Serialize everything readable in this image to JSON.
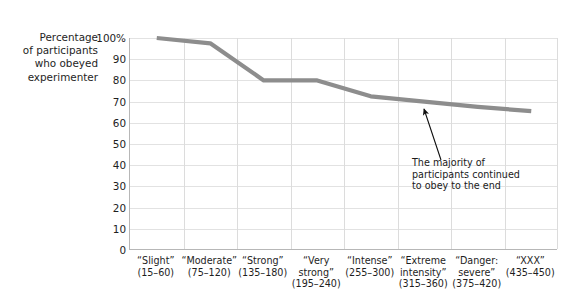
{
  "chart_data": {
    "type": "line",
    "title": "",
    "subtitle": "",
    "ylabel": "Percentage\nof participants\nwho obeyed\nexperimenter",
    "xlabel": "",
    "ylim": [
      0,
      100
    ],
    "ytick_values": [
      100,
      90,
      80,
      70,
      60,
      50,
      40,
      30,
      20,
      10,
      0
    ],
    "ytick_labels": [
      "100%",
      "90",
      "80",
      "70",
      "60",
      "50",
      "40",
      "30",
      "20",
      "10",
      "0"
    ],
    "grid": "both",
    "legend": "none",
    "line_color": "#8d8d8d",
    "categories": [
      "“Slight”\n(15–60)",
      "“Moderate”\n(75–120)",
      "“Strong”\n(135–180)",
      "“Very\nstrong”\n(195–240)",
      "“Intense”\n(255–300)",
      "“Extreme\nintensity”\n(315–360)",
      "“Danger:\nsevere”\n(375–420)",
      "“XXX”\n(435–450)"
    ],
    "category_names": [
      "Slight",
      "Moderate",
      "Strong",
      "Very strong",
      "Intense",
      "Extreme intensity",
      "Danger: severe",
      "XXX"
    ],
    "category_ranges": [
      "15–60",
      "75–120",
      "135–180",
      "195–240",
      "255–300",
      "315–360",
      "375–420",
      "435–450"
    ],
    "values": [
      100,
      97.5,
      80,
      80,
      72.5,
      70,
      67.5,
      65.5
    ],
    "annotations": [
      {
        "text": "The majority of\nparticipants continued\nto obey to the end",
        "points_to_category": "“XXX”",
        "points_to_value": 65.5
      }
    ]
  },
  "axis": {
    "y_title": "Percentage\nof participants\nwho obeyed\nexperimenter"
  },
  "annotation": {
    "text": "The majority of\nparticipants continued\nto obey to the end"
  }
}
